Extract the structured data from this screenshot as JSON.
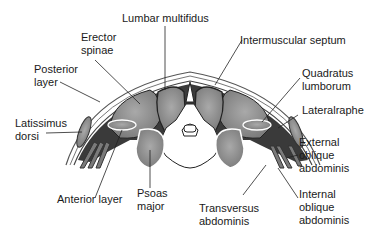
{
  "diagram": {
    "labels": {
      "lumbar_multifidus": "Lumbar multifidus",
      "erector_spinae": "Erector\nspinae",
      "intermuscular_septum": "Intermuscular septum",
      "posterior_layer": "Posterior\nlayer",
      "quadratus_lumborum": "Quadratus\nlumborum",
      "latissimus_dorsi": "Latissimus\ndorsi",
      "lateral_raphe": "Lateralraphe",
      "external_oblique": "External\noblique\nabdominis",
      "anterior_layer": "Anterior layer",
      "psoas_major": "Psoas\nmajor",
      "transversus_abdominis": "Transversus\nabdominis",
      "internal_oblique": "Internal\noblique\nabdominis"
    },
    "colors": {
      "muscle": "#8c8c8c",
      "muscle_highlight": "#a8a8a8",
      "fascia_dark": "#3a3a3a",
      "bone": "#ffffff",
      "outline": "#222222",
      "text": "#1a1a1a"
    }
  }
}
